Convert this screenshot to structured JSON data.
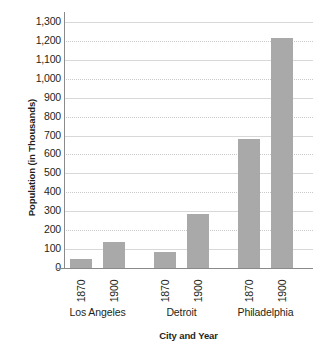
{
  "chart_data": {
    "type": "bar",
    "title": "",
    "xlabel": "City and Year",
    "ylabel": "Population (in Thousands)",
    "ylim": [
      0,
      1300
    ],
    "ytick_step": 100,
    "ytick_labels": [
      "1,300",
      "1,200",
      "1,100",
      "1,000",
      "900",
      "800",
      "700",
      "600",
      "500",
      "400",
      "300",
      "200",
      "100",
      "0"
    ],
    "ytick_values": [
      1300,
      1200,
      1100,
      1000,
      900,
      800,
      700,
      600,
      500,
      400,
      300,
      200,
      100,
      0
    ],
    "grid": true,
    "legend": "none",
    "bar_color": "#a9a9a9",
    "axis_color": "#8a8a8a",
    "grid_color": "#c9c9c9",
    "groups": [
      "Los Angeles",
      "Detroit",
      "Philadelphia"
    ],
    "categories": [
      "1870",
      "1900",
      "1870",
      "1900",
      "1870",
      "1900"
    ],
    "values": [
      50,
      140,
      85,
      285,
      680,
      1215
    ],
    "bars": [
      {
        "group": "Los Angeles",
        "year": "1870",
        "value": 50
      },
      {
        "group": "Los Angeles",
        "year": "1900",
        "value": 140
      },
      {
        "group": "Detroit",
        "year": "1870",
        "value": 85
      },
      {
        "group": "Detroit",
        "year": "1900",
        "value": 285
      },
      {
        "group": "Philadelphia",
        "year": "1870",
        "value": 680
      },
      {
        "group": "Philadelphia",
        "year": "1900",
        "value": 1215
      }
    ]
  }
}
